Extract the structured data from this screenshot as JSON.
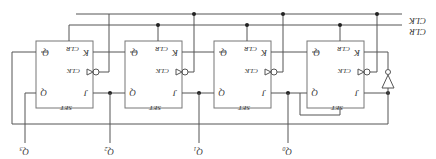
{
  "diagram": {
    "orientation": "rotated-180",
    "signals": {
      "clk_label": "CLK",
      "clr_label": "CLR"
    },
    "flip_flops": [
      {
        "id": "ff3",
        "q_label": "Q",
        "qbar_label": "Q",
        "j_label": "J",
        "k_label": "K",
        "clk_label": "CLK",
        "clr_label": "CLR",
        "set_label": "SET"
      },
      {
        "id": "ff2",
        "q_label": "Q",
        "qbar_label": "Q",
        "j_label": "J",
        "k_label": "K",
        "clk_label": "CLK",
        "clr_label": "CLR",
        "set_label": "SET"
      },
      {
        "id": "ff1",
        "q_label": "Q",
        "qbar_label": "Q",
        "j_label": "J",
        "k_label": "K",
        "clk_label": "CLK",
        "clr_label": "CLR",
        "set_label": "SET"
      },
      {
        "id": "ff0",
        "q_label": "Q",
        "qbar_label": "Q",
        "j_label": "J",
        "k_label": "K",
        "clk_label": "CLK",
        "clr_label": "CLR",
        "set_label": "SET"
      }
    ],
    "outputs": [
      {
        "label": "Q",
        "sub": "3"
      },
      {
        "label": "Q",
        "sub": "2"
      },
      {
        "label": "Q",
        "sub": "1"
      },
      {
        "label": "Q",
        "sub": "0"
      }
    ],
    "gates": [
      {
        "type": "inverter",
        "name": "clock-inverter"
      }
    ]
  }
}
